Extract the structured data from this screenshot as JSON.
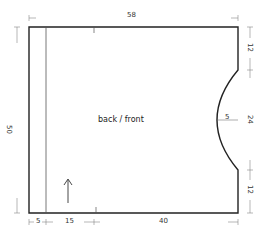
{
  "diagram": {
    "type": "sewing-pattern",
    "piece_label": "back / front",
    "stroke_color": "#222222",
    "dimension_color": "#555555",
    "dimensions": {
      "top_width": "58",
      "left_height": "50",
      "right_top": "12",
      "right_middle": "24",
      "right_bottom": "12",
      "arc_depth": "5",
      "bottom_left": "5",
      "bottom_middle": "15",
      "bottom_right": "40"
    },
    "grain_arrow": "up"
  }
}
